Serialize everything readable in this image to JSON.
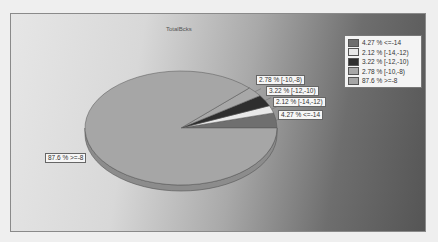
{
  "chart_data": {
    "type": "pie",
    "title": "TotalBcks",
    "categories": [
      "<=-14",
      "[-14,-12)",
      "[-12,-10)",
      "[-10,-8)",
      ">=-8"
    ],
    "values": [
      4.27,
      2.12,
      3.22,
      2.78,
      87.6
    ],
    "unit": "%",
    "legend_position": "top-right",
    "three_d": true,
    "labels": [
      "4.27 % <=-14",
      "2.12 % [-14,-12)",
      "3.22 % [-12,-10)",
      "2.78 % [-10,-8)",
      "87.6 % >=-8"
    ],
    "colors": [
      "#6f6f6f",
      "#e9e9e9",
      "#2e2e2e",
      "#a8a8a8",
      "#a6a6a6"
    ]
  },
  "chart": {
    "title": "TotalBcks"
  },
  "legend": {
    "items": [
      {
        "label": "4.27 % <=-14",
        "color": "#6f6f6f"
      },
      {
        "label": "2.12 % [-14,-12)",
        "color": "#e9e9e9"
      },
      {
        "label": "3.22 % [-12,-10)",
        "color": "#2e2e2e"
      },
      {
        "label": "2.78 % [-10,-8)",
        "color": "#a8a8a8"
      },
      {
        "label": "87.6 % >=-8",
        "color": "#a6a6a6"
      }
    ]
  },
  "slice_labels": {
    "s1": "4.27 % <=-14",
    "s2": "2.12 % [-14,-12)",
    "s3": "3.22 % [-12,-10)",
    "s4": "2.78 % [-10,-8)",
    "s5": "87.6 % >=-8"
  }
}
